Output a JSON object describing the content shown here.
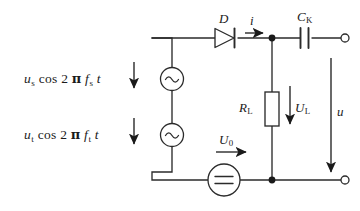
{
  "figure": {
    "type": "circuit-schematic",
    "background_color": "#ffffff",
    "line_color": "#2b2b2b"
  },
  "sources": {
    "ac_top": {
      "symbol": "~",
      "expression_parts": {
        "amplitude": "u",
        "amplitude_sub": "s",
        "function": "cos",
        "factor": "2",
        "pi": "π",
        "frequency": "f",
        "frequency_sub": "s",
        "time": "t"
      },
      "expression_text": "us cos 2 π fs t"
    },
    "ac_bottom": {
      "symbol": "~",
      "expression_parts": {
        "amplitude": "u",
        "amplitude_sub": "t",
        "function": "cos",
        "factor": "2",
        "pi": "π",
        "frequency": "f",
        "frequency_sub": "t",
        "time": "t"
      },
      "expression_text": "ut cos 2 π ft t"
    },
    "dc": {
      "label": "U",
      "label_sub": "0",
      "symbol": "="
    }
  },
  "components": {
    "diode": {
      "label": "D"
    },
    "resistor": {
      "label": "R",
      "label_sub": "L"
    },
    "capacitor": {
      "label": "C",
      "label_sub": "K"
    }
  },
  "quantities": {
    "current": {
      "label": "i"
    },
    "load_voltage": {
      "label": "U",
      "label_sub": "L"
    },
    "output_voltage": {
      "label": "u"
    }
  },
  "terminals": {
    "output_top": "open-terminal",
    "output_bottom": "open-terminal"
  }
}
